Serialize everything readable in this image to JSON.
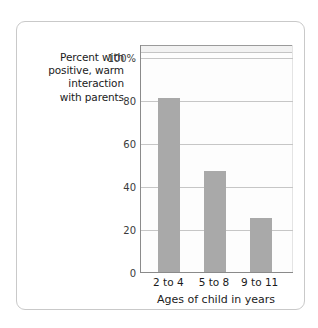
{
  "chart_data": {
    "type": "bar",
    "title": "",
    "subtitle": "",
    "categories": [
      "2 to 4",
      "5 to 8",
      "9 to 11"
    ],
    "values": [
      81,
      47,
      25
    ],
    "xlabel": "Ages of child in years",
    "ylabel": "Percent with positive, warm interaction with parents",
    "ylabel_lines": [
      "Percent with",
      "positive, warm",
      "interaction",
      "with parents"
    ],
    "ylim": [
      0,
      100
    ],
    "ytick_values": [
      0,
      20,
      40,
      60,
      80,
      100
    ],
    "ytick_labels": [
      "0",
      "20",
      "40",
      "60",
      "80",
      "100%"
    ],
    "grid": true,
    "legend": false,
    "legend_position": "none",
    "bar_color": "#a9a9a9",
    "axis_color": "#8a8a8a",
    "gridline_color": "#c6c6c6",
    "plot_background": "#fdfdfd",
    "card_border_color": "#c9c9c9",
    "page_background": "#ffffff"
  }
}
